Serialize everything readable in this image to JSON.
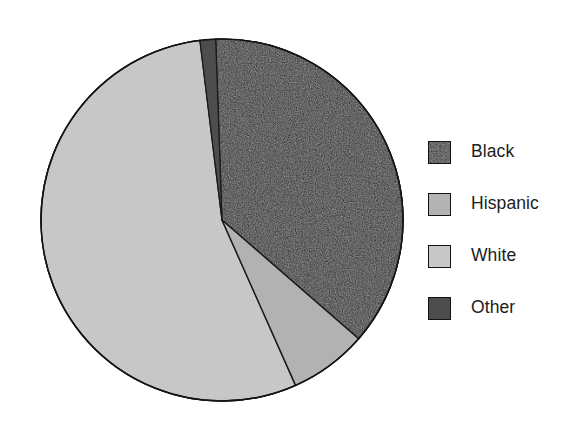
{
  "figure": {
    "type": "pie-chart-figure",
    "background": "#ffffff"
  },
  "chart_data": {
    "type": "pie",
    "title": "",
    "subtitle": "",
    "xlabel": "",
    "ylabel": "",
    "grid": false,
    "legend_position": "right",
    "categories": [
      "Black",
      "Hispanic",
      "White",
      "Other"
    ],
    "values": [
      37.0,
      7.0,
      54.4,
      1.6
    ],
    "value_unit": "percent",
    "slice_order_clockwise_from_12oclock": [
      "Other",
      "Black",
      "Hispanic",
      "White"
    ],
    "start_angle_deg": 353,
    "direction": "clockwise",
    "colors": [
      "#1a1a1a",
      "#b2b2b2",
      "#c8c8c8",
      "#4d4d4d"
    ],
    "slices": [
      {
        "label": "Black",
        "value": 37.0,
        "color": "#1a1a1a",
        "start_angle_deg": 358,
        "end_angle_deg": 131
      },
      {
        "label": "Hispanic",
        "value": 7.0,
        "color": "#b2b2b2",
        "start_angle_deg": 131,
        "end_angle_deg": 156
      },
      {
        "label": "White",
        "value": 54.4,
        "color": "#c8c8c8",
        "start_angle_deg": 156,
        "end_angle_deg": 353
      },
      {
        "label": "Other",
        "value": 1.6,
        "color": "#4d4d4d",
        "start_angle_deg": 353,
        "end_angle_deg": 358
      }
    ],
    "data_labels_shown": false,
    "annotations": []
  },
  "legend": {
    "items": [
      {
        "label": "Black",
        "color": "#1a1a1a",
        "swatch_name": "legend-swatch-black"
      },
      {
        "label": "Hispanic",
        "color": "#b2b2b2",
        "swatch_name": "legend-swatch-hispanic"
      },
      {
        "label": "White",
        "color": "#c8c8c8",
        "swatch_name": "legend-swatch-white"
      },
      {
        "label": "Other",
        "color": "#4d4d4d",
        "swatch_name": "legend-swatch-other"
      }
    ]
  }
}
